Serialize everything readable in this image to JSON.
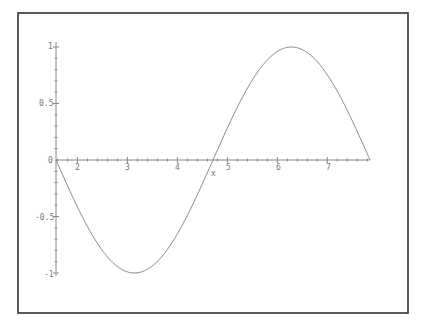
{
  "chart_data": {
    "type": "line",
    "title": "",
    "xlabel": "x",
    "ylabel": "",
    "function": "cos(x)",
    "xlim": [
      1.5708,
      7.854
    ],
    "ylim": [
      -1,
      1
    ],
    "grid": false,
    "legend": null,
    "x_ticks": [
      2,
      3,
      4,
      5,
      6,
      7
    ],
    "x_tick_labels": [
      "2",
      "3",
      "4",
      "5",
      "6",
      "7"
    ],
    "y_ticks": [
      1,
      0.5,
      0,
      -0.5,
      -1
    ],
    "y_tick_labels": [
      "1",
      "0.5",
      "0",
      "-0.5",
      "-1"
    ],
    "series": [
      {
        "name": "cos(x)",
        "x": [
          1.571,
          2.0,
          2.5,
          3.0,
          3.1416,
          3.5,
          4.0,
          4.5,
          4.712,
          5.0,
          5.5,
          6.0,
          6.283,
          6.5,
          7.0,
          7.5,
          7.854
        ],
        "y": [
          0.0,
          -0.416,
          -0.801,
          -0.99,
          -1.0,
          -0.936,
          -0.654,
          -0.211,
          0.0,
          0.284,
          0.709,
          0.96,
          1.0,
          0.977,
          0.754,
          0.347,
          0.0
        ]
      }
    ],
    "colors": {
      "line": "#8a8a8a",
      "axis": "#888888",
      "frame": "#333333"
    }
  },
  "axis_labels": {
    "x": "x",
    "origin": "0",
    "xticks": [
      "2",
      "3",
      "4",
      "5",
      "6",
      "7"
    ],
    "yticks": [
      "1",
      "0.5",
      "-0.5",
      "-1"
    ]
  }
}
